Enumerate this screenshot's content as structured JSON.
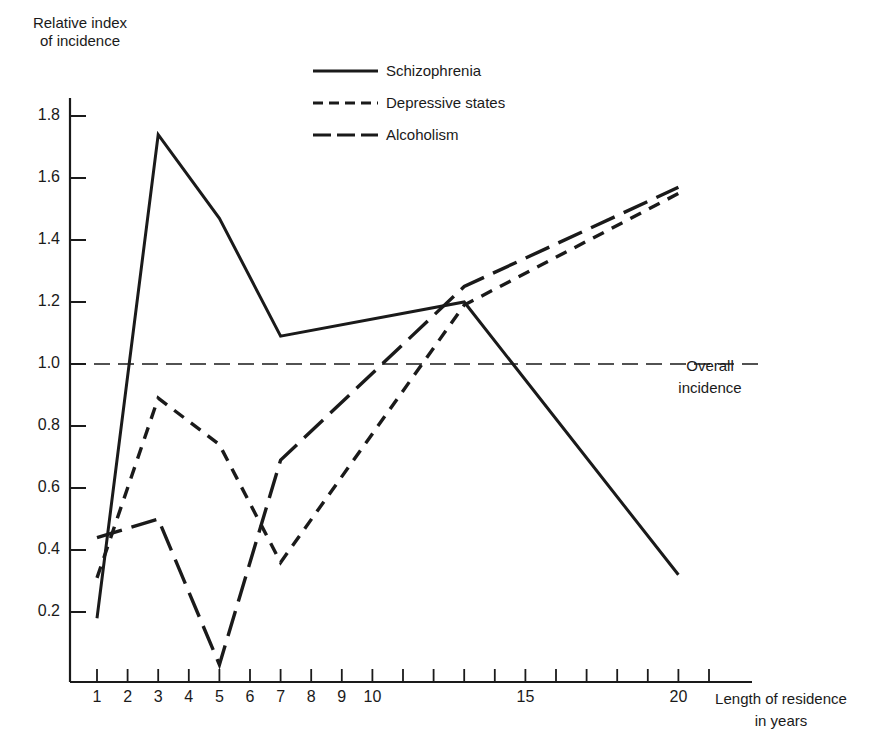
{
  "chart_data": {
    "type": "line",
    "title": "",
    "xlabel": "Length of residence in years",
    "ylabel": "Relative index of incidence",
    "x_ticks": [
      1,
      2,
      3,
      4,
      5,
      6,
      7,
      8,
      9,
      10,
      11,
      12,
      13,
      14,
      15,
      16,
      17,
      18,
      19,
      20,
      21
    ],
    "x_tick_labels": [
      "1",
      "2",
      "3",
      "4",
      "5",
      "6",
      "7",
      "8",
      "9",
      "10",
      "15",
      "20"
    ],
    "y_ticks": [
      0.2,
      0.4,
      0.6,
      0.8,
      1.0,
      1.2,
      1.4,
      1.6,
      1.8
    ],
    "y_tick_labels": [
      "0.2",
      "0.4",
      "0.6",
      "0.8",
      "1.0",
      "1.2",
      "1.4",
      "1.6",
      "1.8"
    ],
    "xlim": [
      0,
      22
    ],
    "ylim": [
      0,
      2.0
    ],
    "grid": false,
    "legend_position": "top-center",
    "reference_line": {
      "y": 1.0,
      "label_line1": "Overall",
      "label_line2": "incidence",
      "style": "long-dash"
    },
    "x": [
      1,
      3,
      5,
      7,
      13,
      20
    ],
    "series": [
      {
        "name": "Schizophrenia",
        "style": "solid",
        "values": [
          0.18,
          1.74,
          1.47,
          1.09,
          1.2,
          0.32
        ]
      },
      {
        "name": "Depressive states",
        "style": "short-dash",
        "values": [
          0.31,
          0.89,
          0.74,
          0.36,
          1.19,
          1.55
        ]
      },
      {
        "name": "Alcoholism",
        "style": "long-dash",
        "values": [
          0.44,
          0.5,
          0.03,
          0.69,
          1.25,
          1.57
        ]
      }
    ]
  },
  "labels": {
    "ylabel_line1": "Relative index",
    "ylabel_line2": "of incidence",
    "xlabel_line1": "Length of residence",
    "xlabel_line2": "in years",
    "overall_line1": "Overall",
    "overall_line2": "incidence",
    "legend": [
      "Schizophrenia",
      "Depressive states",
      "Alcoholism"
    ]
  },
  "colors": {
    "ink": "#1a1a1a",
    "background": "#ffffff"
  }
}
